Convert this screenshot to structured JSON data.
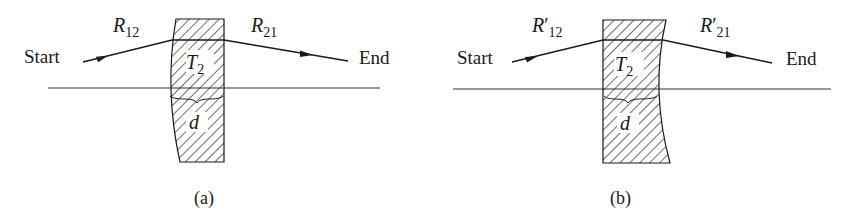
{
  "figure": {
    "panels": [
      {
        "id": "a",
        "caption": "(a)",
        "start_label": "Start",
        "end_label": "End",
        "ray_in_label": "R",
        "ray_in_sub": "12",
        "ray_in_prime": "",
        "ray_out_label": "R",
        "ray_out_sub": "21",
        "ray_out_prime": "",
        "element_label": "T",
        "element_sub": "2",
        "thickness_label": "d",
        "curved_surface": "left"
      },
      {
        "id": "b",
        "caption": "(b)",
        "start_label": "Start",
        "end_label": "End",
        "ray_in_label": "R",
        "ray_in_sub": "12",
        "ray_in_prime": "′",
        "ray_out_label": "R",
        "ray_out_sub": "21",
        "ray_out_prime": "′",
        "element_label": "T",
        "element_sub": "2",
        "thickness_label": "d",
        "curved_surface": "right"
      }
    ]
  }
}
